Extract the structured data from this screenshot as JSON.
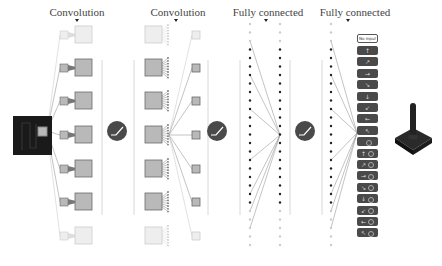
{
  "titles": {
    "conv1": "Convolution",
    "conv2": "Convolution",
    "fc1": "Fully connected",
    "fc2": "Fully connected"
  },
  "layers": {
    "input": {
      "kind": "game-screen"
    },
    "conv1": {
      "rows": 7,
      "faded_rows": [
        0,
        6
      ]
    },
    "relu": {
      "count": 3
    },
    "conv2": {
      "rows": 7,
      "faded_rows": [
        0,
        6
      ]
    },
    "fc1": {
      "columns": 2,
      "dots_per_column": 27
    },
    "fc2": {
      "columns": 1,
      "dots_per_column": 27
    }
  },
  "outputs": {
    "no_input_label": "No input",
    "buttons": [
      {
        "glyph": "↑",
        "fire": false
      },
      {
        "glyph": "↗",
        "fire": false
      },
      {
        "glyph": "→",
        "fire": false
      },
      {
        "glyph": "↘",
        "fire": false
      },
      {
        "glyph": "↓",
        "fire": false
      },
      {
        "glyph": "↙",
        "fire": false
      },
      {
        "glyph": "←",
        "fire": false
      },
      {
        "glyph": "↖",
        "fire": false
      },
      {
        "glyph": "",
        "fire": true
      },
      {
        "glyph": "↑",
        "fire": true
      },
      {
        "glyph": "↗",
        "fire": true
      },
      {
        "glyph": "→",
        "fire": true
      },
      {
        "glyph": "↘",
        "fire": true
      },
      {
        "glyph": "↓",
        "fire": true
      },
      {
        "glyph": "↙",
        "fire": true
      },
      {
        "glyph": "←",
        "fire": true
      },
      {
        "glyph": "↖",
        "fire": true
      }
    ]
  },
  "colors": {
    "dark": "#1a1a1a",
    "square_fill": "#b9b9b9",
    "square_border": "#6a6a6a",
    "faded": "#dddddd",
    "button": "#4a4a4a",
    "relu_circle": "#4a4a4a",
    "line": "#9a9a9a"
  }
}
